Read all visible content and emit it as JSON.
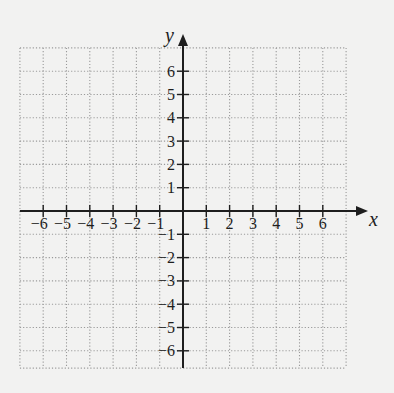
{
  "chart_data": {
    "type": "coordinate-grid",
    "title": "",
    "xlabel": "x",
    "ylabel": "y",
    "xlim": [
      -7,
      7
    ],
    "ylim": [
      -7,
      7
    ],
    "grid": true,
    "grid_style": "dotted",
    "x_ticks": [
      -6,
      -5,
      -4,
      -3,
      -2,
      -1,
      1,
      2,
      3,
      4,
      5,
      6
    ],
    "y_ticks": [
      6,
      5,
      4,
      3,
      2,
      1,
      -1,
      -2,
      -3,
      -4,
      -5,
      -6
    ],
    "x_tick_labels": [
      "−6",
      "−5",
      "−4",
      "−3",
      "−2",
      "−1",
      "1",
      "2",
      "3",
      "4",
      "5",
      "6"
    ],
    "y_tick_labels": [
      "6",
      "5",
      "4",
      "3",
      "2",
      "1",
      "−1",
      "−2",
      "−3",
      "−4",
      "−5",
      "−6"
    ],
    "series": []
  },
  "axes": {
    "x_label": "x",
    "y_label": "y"
  },
  "colors": {
    "background": "#f2f2f1",
    "grid": "#9a9a9a",
    "axis": "#1e1e1e",
    "text": "#1e1e1e"
  }
}
